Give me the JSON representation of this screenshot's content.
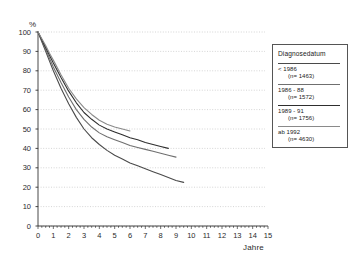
{
  "chart_data": {
    "type": "line",
    "title": "",
    "xlabel": "Jahre",
    "ylabel": "%",
    "xlim": [
      0,
      15
    ],
    "ylim": [
      0,
      100
    ],
    "grid": true,
    "legend_position": "right",
    "legend_title": "Diagnosedatum",
    "x_ticks": [
      "0",
      "1",
      "2",
      "3",
      "4",
      "5",
      "6",
      "7",
      "8",
      "9",
      "10",
      "11",
      "12",
      "13",
      "14",
      "15"
    ],
    "y_ticks": [
      "0",
      "10",
      "20",
      "30",
      "40",
      "50",
      "60",
      "70",
      "80",
      "90",
      "100"
    ],
    "series": [
      {
        "name": "< 1986",
        "n_label": "(n= 1463)",
        "color": "#4a4a4a",
        "x": [
          0,
          0.25,
          0.5,
          0.75,
          1,
          1.5,
          2,
          2.5,
          3,
          3.5,
          4,
          4.5,
          5,
          5.5,
          6,
          6.5,
          7,
          7.5,
          8,
          8.5,
          9,
          9.5
        ],
        "y": [
          100,
          95,
          90,
          85,
          80,
          71,
          63,
          56,
          50,
          45.5,
          42,
          39,
          36.5,
          34.5,
          32.5,
          31,
          29.5,
          28,
          26.5,
          25,
          23.5,
          22.5
        ]
      },
      {
        "name": "1986 - 88",
        "n_label": "(n= 1572)",
        "color": "#6f6f6f",
        "x": [
          0,
          0.25,
          0.5,
          0.75,
          1,
          1.5,
          2,
          2.5,
          3,
          3.5,
          4,
          4.5,
          5,
          5.5,
          6,
          6.5,
          7,
          7.5,
          8,
          8.5,
          9
        ],
        "y": [
          100,
          95.5,
          91,
          86.5,
          82,
          74,
          66.5,
          60,
          55,
          51,
          48,
          46,
          44.5,
          43,
          41.5,
          40.5,
          39.5,
          38.5,
          37.5,
          36.5,
          35.5
        ]
      },
      {
        "name": "1989 - 91",
        "n_label": "(n= 1756)",
        "color": "#2e2e2e",
        "x": [
          0,
          0.25,
          0.5,
          0.75,
          1,
          1.5,
          2,
          2.5,
          3,
          3.5,
          4,
          4.5,
          5,
          5.5,
          6,
          6.5,
          7,
          7.5,
          8,
          8.5
        ],
        "y": [
          100,
          96,
          92,
          88,
          84,
          76.5,
          69.5,
          63.5,
          58.5,
          55,
          52,
          50,
          48.5,
          47,
          45.5,
          44.5,
          43,
          42,
          41,
          40
        ]
      },
      {
        "name": "ab 1992",
        "n_label": "(n= 4630)",
        "color": "#8a8a8a",
        "x": [
          0,
          0.25,
          0.5,
          0.75,
          1,
          1.5,
          2,
          2.5,
          3,
          3.5,
          4,
          4.5,
          5,
          5.5,
          6
        ],
        "y": [
          100,
          96.5,
          93,
          89,
          85.5,
          78,
          71,
          65.5,
          61,
          57.5,
          54.5,
          52.5,
          51,
          50,
          49
        ]
      }
    ]
  }
}
